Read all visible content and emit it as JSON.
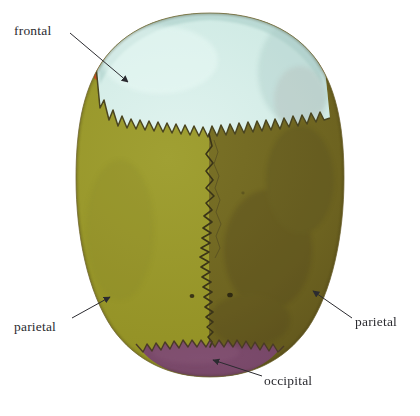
{
  "figure": {
    "background_color": "#ffffff",
    "regions": [
      {
        "id": "frontal",
        "label": "frontal",
        "color": "#cfeae4",
        "description": "frontal bone, pale mint"
      },
      {
        "id": "parietal-left",
        "label": "parietal",
        "color": "#95932b",
        "description": "left parietal bone, olive"
      },
      {
        "id": "parietal-right",
        "label": "parietal",
        "color": "#6b6120",
        "description": "right parietal bone, dark olive"
      },
      {
        "id": "occipital",
        "label": "occipital",
        "color": "#714263",
        "description": "occipital bone, muted purple"
      },
      {
        "id": "orbital-margin",
        "label": "",
        "color": "#e8622a",
        "description": "orange accents at lateral frontal margins"
      }
    ],
    "sutures": [
      {
        "id": "coronal-suture",
        "style": "serrated"
      },
      {
        "id": "sagittal-suture",
        "style": "zigzag"
      },
      {
        "id": "lambdoid-suture",
        "style": "serrated"
      }
    ],
    "foramina_count": 3,
    "label_color": "#2b2b30",
    "leader_color": "#2b2b30"
  },
  "labels": {
    "frontal": "frontal",
    "parietal_left": "parietal",
    "parietal_right": "parietal",
    "occipital": "occipital"
  }
}
